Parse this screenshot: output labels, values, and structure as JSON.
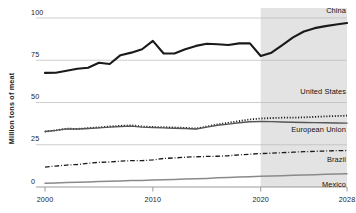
{
  "chart_data": {
    "type": "line",
    "title": "",
    "subtitle": "",
    "xlabel": "",
    "ylabel": "Million tons of meat",
    "xlim": [
      2000,
      2028
    ],
    "ylim": [
      0,
      100
    ],
    "xticks": [
      "2000",
      "2010",
      "2020",
      "2028"
    ],
    "xtick_values": [
      2000,
      2010,
      2020,
      2028
    ],
    "yticks": [
      "0",
      "25",
      "50",
      "75",
      "100"
    ],
    "ytick_values": [
      0,
      25,
      50,
      75,
      100
    ],
    "grid": true,
    "legend_position": "inline-right",
    "forecast_start": 2020,
    "forecast_shading": "#e3e3e3",
    "x": [
      2000,
      2001,
      2002,
      2003,
      2004,
      2005,
      2006,
      2007,
      2008,
      2009,
      2010,
      2011,
      2012,
      2013,
      2014,
      2015,
      2016,
      2017,
      2018,
      2019,
      2020,
      2021,
      2022,
      2023,
      2024,
      2025,
      2026,
      2027,
      2028
    ],
    "series": [
      {
        "name": "China",
        "color": "#1a1a1a",
        "style": "solid",
        "width": 2.1,
        "label": "China",
        "values": [
          67.5,
          67.6,
          68.8,
          70.0,
          70.6,
          73.5,
          72.8,
          78.0,
          79.5,
          81.5,
          86.5,
          79.0,
          79.0,
          81.5,
          83.5,
          84.8,
          84.5,
          84.0,
          85.0,
          85.0,
          77.5,
          79.5,
          84.0,
          88.5,
          92.0,
          94.0,
          95.2,
          96.2,
          97.0
        ]
      },
      {
        "name": "United States",
        "color": "#1a1a1a",
        "style": "dotted",
        "width": 1.8,
        "label": "United States",
        "values": [
          32.8,
          33.5,
          34.5,
          34.4,
          34.8,
          35.3,
          35.8,
          36.2,
          36.5,
          35.8,
          35.5,
          35.4,
          35.2,
          35.0,
          34.6,
          35.8,
          37.0,
          38.0,
          39.0,
          40.0,
          40.5,
          40.8,
          41.0,
          41.0,
          41.2,
          41.5,
          41.8,
          42.0,
          42.2
        ]
      },
      {
        "name": "European Union",
        "color": "#555555",
        "style": "solid",
        "width": 1.4,
        "label": "European Union",
        "values": [
          32.8,
          33.5,
          34.4,
          34.3,
          34.6,
          35.0,
          35.4,
          35.8,
          36.0,
          35.4,
          35.2,
          35.0,
          34.8,
          34.6,
          34.3,
          35.4,
          36.5,
          37.2,
          38.0,
          38.6,
          38.8,
          38.7,
          38.5,
          38.3,
          38.2,
          38.1,
          38.0,
          37.9,
          37.8
        ]
      },
      {
        "name": "Brazil",
        "color": "#1a1a1a",
        "style": "dashdot",
        "width": 1.3,
        "label": "Brazil",
        "values": [
          11.8,
          12.4,
          13.0,
          13.3,
          14.0,
          14.6,
          14.8,
          15.3,
          15.6,
          15.6,
          16.0,
          16.9,
          17.2,
          17.6,
          17.9,
          18.1,
          18.2,
          18.5,
          19.0,
          19.4,
          19.8,
          20.0,
          20.3,
          20.6,
          20.9,
          21.1,
          21.3,
          21.5,
          21.6
        ]
      },
      {
        "name": "Mexico",
        "color": "#8a8a8a",
        "style": "solid",
        "width": 1.5,
        "label": "Mexico",
        "values": [
          2.2,
          2.4,
          2.6,
          2.8,
          3.0,
          3.2,
          3.4,
          3.6,
          3.8,
          3.9,
          4.1,
          4.3,
          4.5,
          4.7,
          4.9,
          5.1,
          5.4,
          5.6,
          5.9,
          6.1,
          6.3,
          6.5,
          6.7,
          6.9,
          7.1,
          7.3,
          7.5,
          7.7,
          7.9
        ]
      }
    ]
  }
}
